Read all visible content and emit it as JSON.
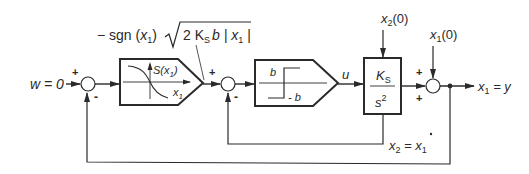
{
  "diagram": {
    "type": "control-block-diagram",
    "colors": {
      "line": "#2a2a2a",
      "background": "#ffffff"
    },
    "input": {
      "label": "w = 0"
    },
    "junctions": [
      {
        "id": "sum1",
        "signs": {
          "left": "+",
          "bottom": "-"
        }
      },
      {
        "id": "sum2",
        "signs": {
          "left": "+",
          "bottom": "-"
        }
      },
      {
        "id": "sum3",
        "signs": {
          "top": "+",
          "left": "+"
        }
      }
    ],
    "blocks": [
      {
        "id": "switching-curve",
        "shape": "pentagon",
        "annotation": "- sgn (x1) √(2 Ks b | x1 |)",
        "annotation_parts": {
          "prefix": "− sgn (",
          "var": "x",
          "sub": "1",
          "mid": ")",
          "radical": "2 K",
          "radical_sub": "S",
          "radical_rest": "b | ",
          "radical_var": "x",
          "radical_var_sub": "1",
          "radical_end": " |"
        },
        "graph": {
          "y_label": "S(x",
          "y_label_sub": "1",
          "y_label_end": ")",
          "x_label": "x",
          "x_label_sub": "1"
        }
      },
      {
        "id": "relay",
        "shape": "pentagon",
        "graph": {
          "upper_label": "b",
          "lower_label": "- b"
        }
      },
      {
        "id": "plant",
        "shape": "rectangle",
        "numerator": "K",
        "numerator_sub": "S",
        "denominator": "s",
        "denominator_sup": "2"
      }
    ],
    "signals": {
      "u": "u",
      "x2_init": {
        "var": "x",
        "sub": "2",
        "rest": "(0)"
      },
      "x1_init": {
        "var": "x",
        "sub": "1",
        "rest": "(0)"
      },
      "output": {
        "var": "x",
        "sub": "1",
        "rest": " = y"
      },
      "velocity": {
        "var": "x",
        "sub": "2",
        "eq": " = ",
        "dot_var": "x",
        "dot_sub": "1"
      }
    },
    "sign_symbols": {
      "plus": "+",
      "minus": "-"
    }
  }
}
